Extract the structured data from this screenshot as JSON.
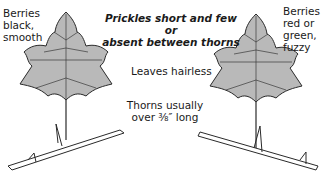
{
  "labels": {
    "left_berries": [
      "Berries",
      "black,",
      "smooth"
    ],
    "right_berries": [
      "Berries",
      "red or",
      "green,",
      "fuzzy"
    ],
    "prickles": [
      "Prickles short and few or",
      "absent between thorns"
    ],
    "leaves": "Leaves hairless",
    "thorns": [
      "Thorns usually",
      "over ⅜″ long"
    ]
  },
  "colors": {
    "leaf_fill": "#b9b9b9",
    "outline": "#2a2a2a",
    "background": "#ffffff"
  }
}
